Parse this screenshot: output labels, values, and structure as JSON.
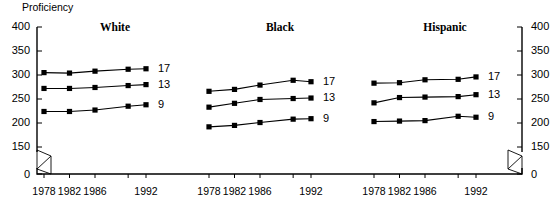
{
  "axis": {
    "y_title": "Proficiency",
    "y_ticks_left": [
      "400",
      "350",
      "300",
      "250",
      "200",
      "150",
      "0"
    ],
    "y_ticks_right": [
      "400",
      "350",
      "300",
      "250",
      "200",
      "150",
      "0"
    ],
    "x_tick_labels": [
      "1978",
      "1982",
      "1986",
      "1992"
    ],
    "break_between": [
      "150",
      "0"
    ],
    "color": "#000000"
  },
  "chart_data": {
    "type": "line",
    "title": "Proficiency",
    "xlabel": "",
    "ylabel": "Proficiency",
    "ylim": [
      0,
      400
    ],
    "yticks": [
      150,
      200,
      250,
      300,
      350,
      400
    ],
    "axis_break": [
      0,
      150
    ],
    "grid": false,
    "legend": "inline-right-of-each-series",
    "x": [
      1978,
      1982,
      1986,
      1990,
      1992
    ],
    "x_labeled": [
      1978,
      1982,
      1986,
      1992
    ],
    "panels": [
      {
        "name": "White",
        "series": [
          {
            "name": "17",
            "values": [
              305,
              304,
              308,
              312,
              313
            ]
          },
          {
            "name": "13",
            "values": [
              272,
              272,
              274,
              278,
              280
            ]
          },
          {
            "name": "9",
            "values": [
              224,
              224,
              227,
              235,
              238
            ]
          }
        ]
      },
      {
        "name": "Black",
        "series": [
          {
            "name": "17",
            "values": [
              266,
              270,
              279,
              289,
              286
            ]
          },
          {
            "name": "13",
            "values": [
              233,
              241,
              249,
              251,
              252
            ]
          },
          {
            "name": "9",
            "values": [
              192,
              195,
              201,
              208,
              209
            ]
          }
        ]
      },
      {
        "name": "Hispanic",
        "series": [
          {
            "name": "17",
            "values": [
              283,
              284,
              290,
              291,
              296
            ]
          },
          {
            "name": "13",
            "values": [
              242,
              253,
              254,
              255,
              259
            ]
          },
          {
            "name": "9",
            "values": [
              203,
              204,
              205,
              214,
              212
            ]
          }
        ]
      }
    ]
  }
}
